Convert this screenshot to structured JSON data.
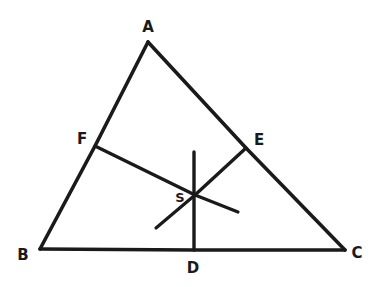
{
  "figure": {
    "kind": "hand-drawn-geometry-diagram",
    "background_color": "#ffffff",
    "ink_color": "#1a1a1a",
    "canvas": {
      "width": 374,
      "height": 287
    }
  },
  "points": {
    "A": {
      "label": "A",
      "x": 148,
      "y": 42,
      "label_x": 148,
      "label_y": 27,
      "role": "apex-vertex"
    },
    "B": {
      "label": "B",
      "x": 40,
      "y": 249,
      "label_x": 23,
      "label_y": 255,
      "role": "bottom-left-vertex"
    },
    "C": {
      "label": "C",
      "x": 345,
      "y": 250,
      "label_x": 357,
      "label_y": 253,
      "role": "bottom-right-vertex"
    },
    "D": {
      "label": "D",
      "x": 194,
      "y": 250,
      "label_x": 193,
      "label_y": 268,
      "role": "midpoint-of-BC"
    },
    "E": {
      "label": "E",
      "x": 246,
      "y": 148,
      "label_x": 259,
      "label_y": 140,
      "role": "midpoint-of-AC"
    },
    "F": {
      "label": "F",
      "x": 95,
      "y": 146,
      "label_x": 82,
      "label_y": 139,
      "role": "midpoint-of-AB"
    },
    "S": {
      "label": "S",
      "x": 195,
      "y": 195,
      "label_x": 180,
      "label_y": 197,
      "role": "centroid"
    }
  },
  "segments": {
    "AB": {
      "name": "side-AB",
      "from": "A",
      "to": "B"
    },
    "AC": {
      "name": "side-AC",
      "from": "A",
      "to": "C"
    },
    "BC": {
      "name": "side-BC",
      "from": "B",
      "to": "C"
    },
    "AD": {
      "name": "median-AD",
      "from_x": 194,
      "from_y": 152,
      "to_x": 194,
      "to_y": 250
    },
    "FS": {
      "name": "median-CF-part",
      "from_x": 95,
      "from_y": 146,
      "to_x": 195,
      "to_y": 195
    },
    "ES": {
      "name": "median-BE-part",
      "from_x": 246,
      "from_y": 148,
      "to_x": 195,
      "to_y": 195
    },
    "FS_ext": {
      "name": "median-CF-extension",
      "from_x": 195,
      "from_y": 195,
      "to_x": 238,
      "to_y": 212
    },
    "ES_ext": {
      "name": "median-BE-extension",
      "from_x": 195,
      "from_y": 195,
      "to_x": 156,
      "to_y": 228
    }
  },
  "labels": {
    "A": "A",
    "B": "B",
    "C": "C",
    "D": "D",
    "E": "E",
    "F": "F",
    "S": "S"
  }
}
